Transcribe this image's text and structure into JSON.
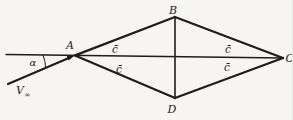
{
  "figure": {
    "background": "#f6f5f2",
    "ink": "#1d1d1b",
    "vertices": {
      "a": "A",
      "b": "B",
      "c": "C",
      "d": "D"
    },
    "angle_label": "α",
    "freestream": {
      "base": "V",
      "subscript": "∞"
    },
    "chord_labels": {
      "upper_left": "c̄",
      "lower_left": "c̄",
      "upper_right": "c̄",
      "lower_right": "c̄"
    }
  }
}
